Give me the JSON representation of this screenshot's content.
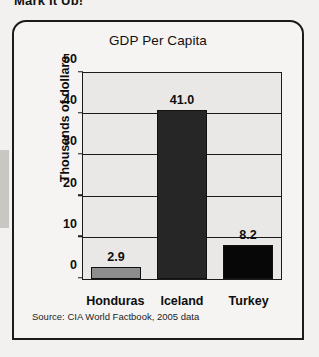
{
  "page": {
    "heading_partial": "Mark It Up!"
  },
  "figure": {
    "source_note": "Source: CIA World Factbook, 2005 data"
  },
  "chart_data": {
    "type": "bar",
    "title": "GDP Per Capita",
    "xlabel": "",
    "ylabel": "Thousands of dollars",
    "categories": [
      "Honduras",
      "Iceland",
      "Turkey"
    ],
    "values": [
      2.9,
      41.0,
      8.2
    ],
    "value_labels": [
      "2.9",
      "41.0",
      "8.2"
    ],
    "bar_colors": [
      "#8d8d8d",
      "#262626",
      "#070707"
    ],
    "ylim": [
      0,
      50
    ],
    "yticks": [
      0,
      10,
      20,
      30,
      40,
      50
    ],
    "ytick_labels": [
      "0",
      "10",
      "20",
      "30",
      "40",
      "50"
    ],
    "grid": true,
    "grid_axis": "y",
    "legend": false,
    "plot_background": "#e9e8e6",
    "axis_color": "#1b1b1b"
  }
}
